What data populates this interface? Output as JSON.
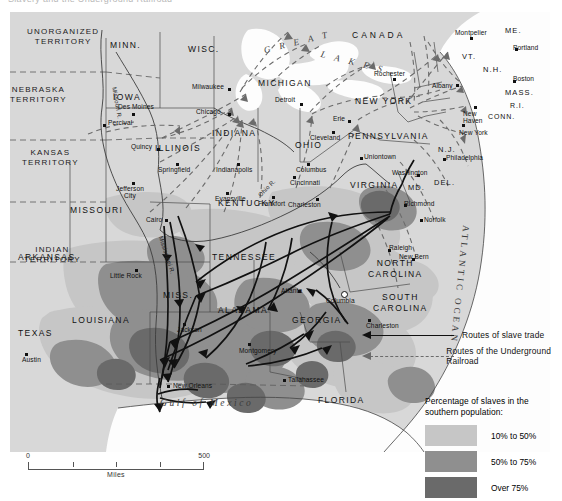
{
  "title": "Slavery and the Underground Railroad",
  "map": {
    "water_labels": [
      {
        "name": "GREAT LAKES",
        "text": "G R E A T"
      },
      {
        "name": "great-lakes-second",
        "text": "L A K E S"
      },
      {
        "name": "gulf-of-mexico",
        "text": "Gulf of Mexico"
      },
      {
        "name": "atlantic-ocean",
        "text": "ATLANTIC OCEAN"
      }
    ],
    "countries": [
      {
        "label": "CANADA"
      }
    ],
    "territories": [
      {
        "label": "UNORGANIZED",
        "label2": "TERRITORY"
      },
      {
        "label": "NEBRASKA",
        "label2": "TERRITORY"
      },
      {
        "label": "KANSAS",
        "label2": "TERRITORY"
      },
      {
        "label": "INDIAN",
        "label2": "TERRITORY"
      }
    ],
    "states": [
      {
        "label": "MINN."
      },
      {
        "label": "WISC."
      },
      {
        "label": "IOWA"
      },
      {
        "label": "MICHIGAN"
      },
      {
        "label": "ILLINOIS"
      },
      {
        "label": "INDIANA"
      },
      {
        "label": "OHIO"
      },
      {
        "label": "NEW YORK"
      },
      {
        "label": "PENNSYLVANIA"
      },
      {
        "label": "ME."
      },
      {
        "label": "VT."
      },
      {
        "label": "N.H."
      },
      {
        "label": "MASS."
      },
      {
        "label": "R.I."
      },
      {
        "label": "CONN."
      },
      {
        "label": "N.J."
      },
      {
        "label": "DEL."
      },
      {
        "label": "MD."
      },
      {
        "label": "MISSOURI"
      },
      {
        "label": "KENTUCKY"
      },
      {
        "label": "VIRGINIA"
      },
      {
        "label": "ARKANSAS"
      },
      {
        "label": "TENNESSEE"
      },
      {
        "label": "NORTH",
        "label2": "CAROLINA"
      },
      {
        "label": "SOUTH",
        "label2": "CAROLINA"
      },
      {
        "label": "MISS."
      },
      {
        "label": "ALABAMA"
      },
      {
        "label": "GEORGIA"
      },
      {
        "label": "LOUISIANA"
      },
      {
        "label": "TEXAS"
      },
      {
        "label": "FLORIDA"
      }
    ],
    "rivers": [
      {
        "label": "Missouri R."
      },
      {
        "label": "Mississippi R."
      },
      {
        "label": "Ohio R."
      }
    ],
    "cities": [
      {
        "label": "Des Moines"
      },
      {
        "label": "Percival"
      },
      {
        "label": "Milwaukee"
      },
      {
        "label": "Chicago"
      },
      {
        "label": "Detroit"
      },
      {
        "label": "Quincy"
      },
      {
        "label": "Springfield"
      },
      {
        "label": "Indianapolis"
      },
      {
        "label": "Columbus"
      },
      {
        "label": "Cincinnati"
      },
      {
        "label": "Cleveland"
      },
      {
        "label": "Erie"
      },
      {
        "label": "Rochester"
      },
      {
        "label": "Albany"
      },
      {
        "label": "Montpelier"
      },
      {
        "label": "Portland"
      },
      {
        "label": "Boston"
      },
      {
        "label": "New Haven"
      },
      {
        "label": "New York"
      },
      {
        "label": "Philadelphia"
      },
      {
        "label": "Uniontown"
      },
      {
        "label": "Washington"
      },
      {
        "label": "Jefferson City"
      },
      {
        "label": "Evansville"
      },
      {
        "label": "Frankfort"
      },
      {
        "label": "Charleston"
      },
      {
        "label": "Richmond"
      },
      {
        "label": "Norfolk"
      },
      {
        "label": "Cairo"
      },
      {
        "label": "Little Rock"
      },
      {
        "label": "Raleigh"
      },
      {
        "label": "New Bern"
      },
      {
        "label": "Atlanta"
      },
      {
        "label": "Columbia"
      },
      {
        "label": "Charleston"
      },
      {
        "label": "Jackson"
      },
      {
        "label": "Montgomery"
      },
      {
        "label": "New Orleans"
      },
      {
        "label": "Austin"
      },
      {
        "label": "Tallahassee"
      }
    ]
  },
  "legend": {
    "routes": [
      {
        "label": "Routes of slave trade",
        "style": "solid"
      },
      {
        "label": "Routes of the Underground Railroad",
        "style": "dashed"
      }
    ],
    "density_title_line1": "Percentage of slaves in the",
    "density_title_line2": "southern population:",
    "density": [
      {
        "label": "10% to 50%",
        "color": "#c6c6c6"
      },
      {
        "label": "50% to 75%",
        "color": "#8f8f8f"
      },
      {
        "label": "Over 75%",
        "color": "#6a6a6a"
      }
    ]
  },
  "scale": {
    "zero": "0",
    "max": "500",
    "units": "Miles"
  }
}
